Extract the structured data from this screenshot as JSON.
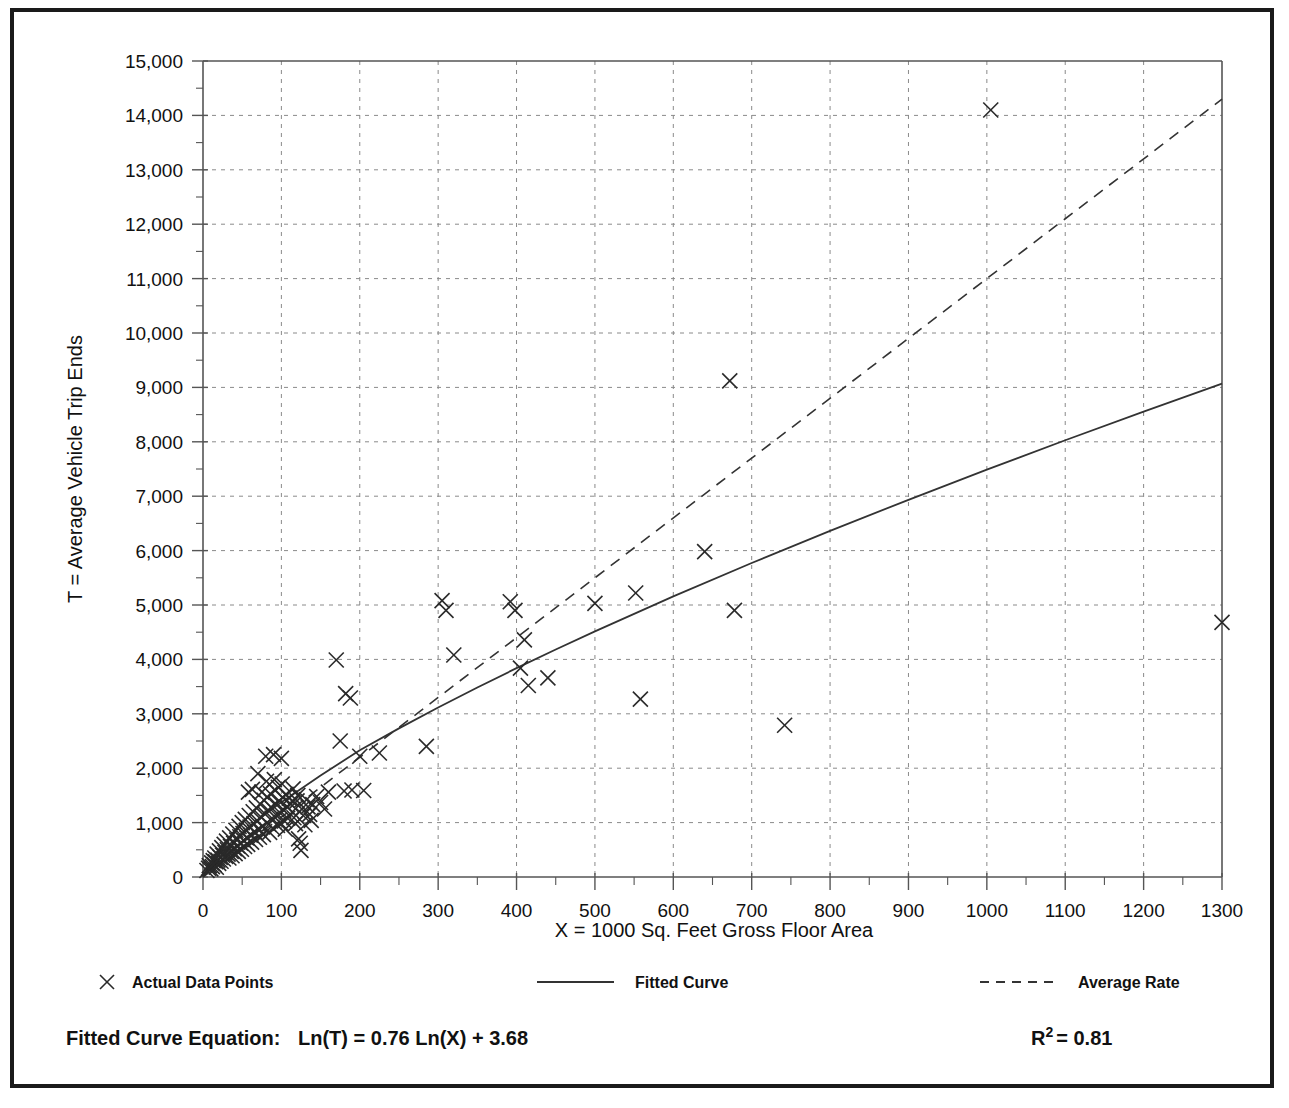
{
  "figure": {
    "frame_color": "#1a1a1a",
    "background": "#ffffff"
  },
  "axes": {
    "y_label": "T = Average Vehicle Trip Ends",
    "x_label": "X = 1000 Sq. Feet Gross Floor Area",
    "y_ticks": [
      "0",
      "1,000",
      "2,000",
      "3,000",
      "4,000",
      "5,000",
      "6,000",
      "7,000",
      "8,000",
      "9,000",
      "10,000",
      "11,000",
      "12,000",
      "13,000",
      "14,000",
      "15,000"
    ],
    "x_ticks": [
      "0",
      "100",
      "200",
      "300",
      "400",
      "500",
      "600",
      "700",
      "800",
      "900",
      "1000",
      "1100",
      "1200",
      "1300"
    ]
  },
  "legend": {
    "items": [
      {
        "label": "Actual Data Points",
        "marker": "x-marker"
      },
      {
        "label": "Fitted Curve",
        "marker": "solid-line"
      },
      {
        "label": "Average Rate",
        "marker": "dashed-line"
      }
    ]
  },
  "footer": {
    "equation_label": "Fitted Curve Equation:",
    "equation": "Ln(T) = 0.76 Ln(X) + 3.68",
    "r_squared_base": "R",
    "r_squared_exp": "2",
    "r_squared_value": "= 0.81"
  },
  "chart_data": {
    "type": "scatter",
    "title": "",
    "xlabel": "X = 1000 Sq. Feet Gross Floor Area",
    "ylabel": "T = Average Vehicle Trip Ends",
    "xlim": [
      0,
      1300
    ],
    "ylim": [
      0,
      15000
    ],
    "x_tick_step": 100,
    "y_tick_step": 1000,
    "x_minor_step": 50,
    "y_minor_step": 500,
    "grid": true,
    "legend_position": "below-axes",
    "annotations": [
      "Fitted Curve Equation:  Ln(T) = 0.76 Ln(X) + 3.68",
      "R2 = 0.81"
    ],
    "series": [
      {
        "name": "Actual Data Points",
        "type": "scatter",
        "marker": "x",
        "points": [
          [
            5,
            120
          ],
          [
            7,
            160
          ],
          [
            8,
            210
          ],
          [
            10,
            150
          ],
          [
            11,
            260
          ],
          [
            12,
            190
          ],
          [
            13,
            300
          ],
          [
            14,
            230
          ],
          [
            15,
            350
          ],
          [
            16,
            280
          ],
          [
            17,
            180
          ],
          [
            18,
            420
          ],
          [
            19,
            310
          ],
          [
            20,
            250
          ],
          [
            21,
            480
          ],
          [
            22,
            360
          ],
          [
            23,
            290
          ],
          [
            24,
            540
          ],
          [
            25,
            400
          ],
          [
            26,
            330
          ],
          [
            27,
            600
          ],
          [
            28,
            450
          ],
          [
            29,
            380
          ],
          [
            30,
            660
          ],
          [
            31,
            500
          ],
          [
            32,
            420
          ],
          [
            33,
            350
          ],
          [
            34,
            720
          ],
          [
            35,
            560
          ],
          [
            36,
            470
          ],
          [
            37,
            390
          ],
          [
            38,
            790
          ],
          [
            39,
            620
          ],
          [
            40,
            520
          ],
          [
            41,
            430
          ],
          [
            42,
            860
          ],
          [
            43,
            680
          ],
          [
            44,
            570
          ],
          [
            45,
            470
          ],
          [
            46,
            930
          ],
          [
            47,
            740
          ],
          [
            48,
            620
          ],
          [
            49,
            510
          ],
          [
            50,
            1000
          ],
          [
            51,
            800
          ],
          [
            52,
            670
          ],
          [
            53,
            560
          ],
          [
            54,
            1060
          ],
          [
            55,
            860
          ],
          [
            56,
            720
          ],
          [
            57,
            600
          ],
          [
            58,
            1560
          ],
          [
            59,
            1130
          ],
          [
            60,
            920
          ],
          [
            61,
            770
          ],
          [
            62,
            640
          ],
          [
            63,
            1610
          ],
          [
            64,
            1200
          ],
          [
            65,
            980
          ],
          [
            66,
            820
          ],
          [
            67,
            690
          ],
          [
            68,
            1270
          ],
          [
            69,
            1040
          ],
          [
            70,
            1900
          ],
          [
            71,
            870
          ],
          [
            72,
            730
          ],
          [
            73,
            1340
          ],
          [
            74,
            1100
          ],
          [
            75,
            1560
          ],
          [
            76,
            920
          ],
          [
            77,
            780
          ],
          [
            78,
            1410
          ],
          [
            79,
            1160
          ],
          [
            80,
            2220
          ],
          [
            81,
            1760
          ],
          [
            82,
            1470
          ],
          [
            83,
            1230
          ],
          [
            84,
            970
          ],
          [
            85,
            820
          ],
          [
            86,
            1530
          ],
          [
            87,
            1280
          ],
          [
            88,
            1080
          ],
          [
            89,
            900
          ],
          [
            90,
            2250
          ],
          [
            91,
            1790
          ],
          [
            92,
            1590
          ],
          [
            93,
            1340
          ],
          [
            94,
            1130
          ],
          [
            95,
            950
          ],
          [
            96,
            1650
          ],
          [
            97,
            1400
          ],
          [
            98,
            1180
          ],
          [
            99,
            990
          ],
          [
            100,
            2180
          ],
          [
            101,
            1710
          ],
          [
            102,
            1460
          ],
          [
            103,
            1230
          ],
          [
            104,
            1030
          ],
          [
            105,
            880
          ],
          [
            106,
            1520
          ],
          [
            107,
            1290
          ],
          [
            108,
            1080
          ],
          [
            110,
            1450
          ],
          [
            112,
            1340
          ],
          [
            114,
            1200
          ],
          [
            115,
            1620
          ],
          [
            116,
            1090
          ],
          [
            118,
            980
          ],
          [
            120,
            1400
          ],
          [
            121,
            1500
          ],
          [
            122,
            700
          ],
          [
            124,
            620
          ],
          [
            125,
            490
          ],
          [
            126,
            1250
          ],
          [
            128,
            1130
          ],
          [
            130,
            960
          ],
          [
            132,
            1420
          ],
          [
            134,
            1290
          ],
          [
            136,
            1150
          ],
          [
            138,
            1040
          ],
          [
            140,
            1330
          ],
          [
            145,
            1480
          ],
          [
            150,
            1370
          ],
          [
            155,
            1250
          ],
          [
            160,
            1560
          ],
          [
            170,
            3990
          ],
          [
            175,
            2500
          ],
          [
            180,
            1580
          ],
          [
            182,
            3370
          ],
          [
            188,
            3290
          ],
          [
            190,
            1600
          ],
          [
            200,
            2220
          ],
          [
            205,
            1590
          ],
          [
            225,
            2280
          ],
          [
            285,
            2400
          ],
          [
            305,
            5080
          ],
          [
            310,
            4900
          ],
          [
            320,
            4080
          ],
          [
            392,
            5060
          ],
          [
            398,
            4900
          ],
          [
            405,
            3840
          ],
          [
            410,
            4360
          ],
          [
            415,
            3520
          ],
          [
            440,
            3660
          ],
          [
            500,
            5030
          ],
          [
            552,
            5220
          ],
          [
            558,
            3270
          ],
          [
            640,
            5980
          ],
          [
            672,
            9120
          ],
          [
            678,
            4900
          ],
          [
            742,
            2790
          ],
          [
            1005,
            14100
          ],
          [
            1300,
            4680
          ]
        ]
      },
      {
        "name": "Fitted Curve",
        "type": "line",
        "style": "solid",
        "equation": "Ln(T) = 0.76 Ln(X) + 3.68",
        "r_squared": 0.81,
        "points": [
          [
            0,
            0
          ],
          [
            10,
            236
          ],
          [
            25,
            480
          ],
          [
            50,
            813
          ],
          [
            75,
            1101
          ],
          [
            100,
            1376
          ],
          [
            150,
            1866
          ],
          [
            200,
            2330
          ],
          [
            250,
            2732
          ],
          [
            300,
            3116
          ],
          [
            350,
            3484
          ],
          [
            400,
            3839
          ],
          [
            450,
            4182
          ],
          [
            500,
            4516
          ],
          [
            600,
            5158
          ],
          [
            700,
            5772
          ],
          [
            800,
            6363
          ],
          [
            900,
            6934
          ],
          [
            1000,
            7489
          ],
          [
            1100,
            8028
          ],
          [
            1200,
            8555
          ],
          [
            1300,
            9070
          ]
        ]
      },
      {
        "name": "Average Rate",
        "type": "line",
        "style": "dashed",
        "points": [
          [
            0,
            0
          ],
          [
            100,
            1100
          ],
          [
            300,
            3300
          ],
          [
            500,
            5500
          ],
          [
            700,
            7700
          ],
          [
            900,
            9900
          ],
          [
            1100,
            12100
          ],
          [
            1300,
            14300
          ]
        ]
      }
    ]
  }
}
